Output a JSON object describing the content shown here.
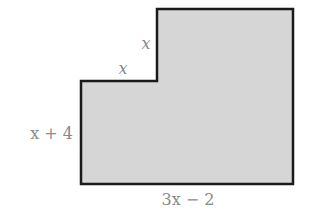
{
  "figure": {
    "shape": "L-shaped polygon (rectangle with top-left notch removed)",
    "colors": {
      "fill": "#d6d6d6",
      "stroke": "#1a1a1a",
      "label": "#8a8a8a"
    },
    "labels": {
      "notch_height": "x",
      "notch_width": "x",
      "left_side": "x + 4",
      "bottom_side": "3x − 2"
    }
  }
}
